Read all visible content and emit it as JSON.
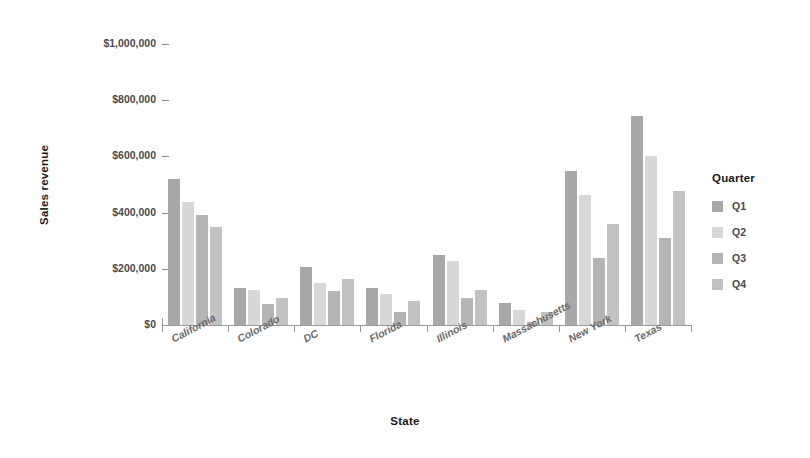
{
  "chart_data": {
    "type": "bar",
    "title": "",
    "xlabel": "State",
    "ylabel": "Sales revenue",
    "categories": [
      "California",
      "Colorado",
      "DC",
      "Florida",
      "Illinois",
      "Massachusetts",
      "New York",
      "Texas"
    ],
    "series": [
      {
        "name": "Q1",
        "color": "#a8a8a8",
        "values": [
          518000,
          130000,
          205000,
          130000,
          248000,
          78000,
          548000,
          745000
        ]
      },
      {
        "name": "Q2",
        "color": "#d8d8d8",
        "values": [
          438000,
          125000,
          150000,
          110000,
          228000,
          55000,
          462000,
          600000
        ]
      },
      {
        "name": "Q3",
        "color": "#b5b5b5",
        "values": [
          392000,
          75000,
          120000,
          45000,
          95000,
          10000,
          240000,
          310000
        ]
      },
      {
        "name": "Q4",
        "color": "#c2c2c2",
        "values": [
          348000,
          95000,
          165000,
          85000,
          125000,
          48000,
          358000,
          478000
        ]
      }
    ],
    "ylim": [
      0,
      1000000
    ],
    "ytick_values": [
      0,
      200000,
      400000,
      600000,
      800000,
      1000000
    ],
    "ytick_labels": [
      "$0",
      "$200,000",
      "$400,000",
      "$600,000",
      "$800,000",
      "$1,000,000"
    ],
    "grid": false,
    "legend_position": "right",
    "legend_title": "Quarter"
  },
  "legend": {
    "title": "Quarter",
    "entries": [
      "Q1",
      "Q2",
      "Q3",
      "Q4"
    ]
  },
  "axes": {
    "y_title": "Sales revenue",
    "x_title": "State"
  }
}
